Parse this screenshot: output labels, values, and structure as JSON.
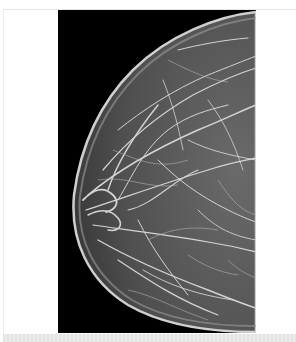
{
  "image": {
    "subject": "mammogram",
    "description": "Grayscale mammogram showing breast tissue profile against a black background",
    "colors": {
      "background": "#ffffff",
      "viewer_background": "#000000",
      "tissue_base": "#5a5a5a",
      "tissue_highlight": "#d8d8d8",
      "bottom_strip": "#e8e8e8"
    }
  }
}
